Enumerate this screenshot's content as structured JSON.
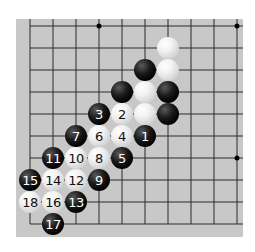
{
  "board": {
    "background": "#c8c8c8",
    "line_color": "#2a2a2a",
    "grid": {
      "origin_x": 30,
      "origin_y": 26,
      "spacing_x": 23,
      "spacing_y": 22,
      "cols": 10,
      "rows": 10
    },
    "edges": {
      "left": true,
      "bottom": true,
      "top": false,
      "right": false
    },
    "star_points": [
      {
        "col": 3,
        "row": 0
      },
      {
        "col": 9,
        "row": 0
      },
      {
        "col": 9,
        "row": 6
      }
    ]
  },
  "stones": [
    {
      "color": "white",
      "col": 6,
      "row": 1,
      "label": ""
    },
    {
      "color": "black",
      "col": 5,
      "row": 2,
      "label": ""
    },
    {
      "color": "white",
      "col": 6,
      "row": 2,
      "label": ""
    },
    {
      "color": "black",
      "col": 4,
      "row": 3,
      "label": ""
    },
    {
      "color": "white",
      "col": 5,
      "row": 3,
      "label": ""
    },
    {
      "color": "black",
      "col": 6,
      "row": 3,
      "label": ""
    },
    {
      "color": "white",
      "col": 5,
      "row": 4,
      "label": ""
    },
    {
      "color": "black",
      "col": 6,
      "row": 4,
      "label": ""
    },
    {
      "color": "black",
      "col": 3,
      "row": 4,
      "label": "3"
    },
    {
      "color": "white",
      "col": 4,
      "row": 4,
      "label": "2"
    },
    {
      "color": "black",
      "col": 2,
      "row": 5,
      "label": "7"
    },
    {
      "color": "white",
      "col": 3,
      "row": 5,
      "label": "6"
    },
    {
      "color": "white",
      "col": 4,
      "row": 5,
      "label": "4"
    },
    {
      "color": "black",
      "col": 5,
      "row": 5,
      "label": "1"
    },
    {
      "color": "black",
      "col": 1,
      "row": 6,
      "label": "11"
    },
    {
      "color": "white",
      "col": 2,
      "row": 6,
      "label": "10"
    },
    {
      "color": "white",
      "col": 3,
      "row": 6,
      "label": "8"
    },
    {
      "color": "black",
      "col": 4,
      "row": 6,
      "label": "5"
    },
    {
      "color": "black",
      "col": 0,
      "row": 7,
      "label": "15"
    },
    {
      "color": "white",
      "col": 1,
      "row": 7,
      "label": "14"
    },
    {
      "color": "white",
      "col": 2,
      "row": 7,
      "label": "12"
    },
    {
      "color": "black",
      "col": 3,
      "row": 7,
      "label": "9"
    },
    {
      "color": "white",
      "col": 0,
      "row": 8,
      "label": "18"
    },
    {
      "color": "white",
      "col": 1,
      "row": 8,
      "label": "16"
    },
    {
      "color": "black",
      "col": 2,
      "row": 8,
      "label": "13"
    },
    {
      "color": "black",
      "col": 1,
      "row": 9,
      "label": "17"
    }
  ]
}
